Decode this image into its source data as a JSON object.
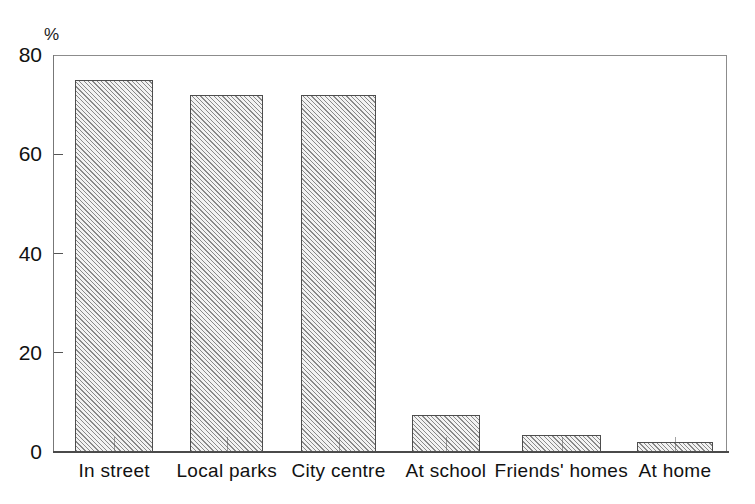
{
  "chart_data": {
    "type": "bar",
    "title": "",
    "subtitle": "",
    "xlabel": "",
    "ylabel": "%",
    "ylim": [
      0,
      80
    ],
    "yticks": [
      0,
      20,
      40,
      60,
      80
    ],
    "grid": false,
    "legend": false,
    "bar_style": "diagonal-hatch",
    "categories": [
      "In street",
      "Local parks",
      "City centre",
      "At school",
      "Friends' homes",
      "At home"
    ],
    "values": [
      75,
      72,
      72,
      7.5,
      3.5,
      2
    ],
    "colors": {
      "bar_fill": "#f2f2f2",
      "bar_edge": "#4d4d4d",
      "axis": "#555555",
      "text": "#111111",
      "background": "#ffffff"
    }
  }
}
